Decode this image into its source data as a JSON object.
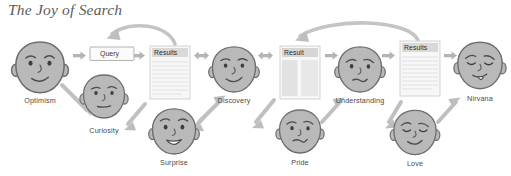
{
  "title": "The Joy of Search",
  "theme": {
    "background": "#ffffff",
    "face_fill": "#b9b9b9",
    "face_stroke": "#6e6e6e",
    "arrow_fill": "#b4b4b4",
    "curve_arrow_fill": "#bfbfbf",
    "doc_fill": "#f4f4f4",
    "doc_stroke": "#c9c9c9",
    "doc_header_fill": "#d8d8d8",
    "doc_line": "#dcdcdc",
    "text": "#4a4a4a",
    "title_text": "#5b5b5b"
  },
  "documents": [
    {
      "id": "query",
      "label": "Query",
      "style": "input-box"
    },
    {
      "id": "results1",
      "label": "Results",
      "style": "lined-page"
    },
    {
      "id": "result2",
      "label": "Result",
      "style": "two-column-page"
    },
    {
      "id": "results3",
      "label": "Results",
      "style": "lined-page"
    }
  ],
  "faces": [
    {
      "id": "optimism",
      "label": "Optimism",
      "emotion": "smiling",
      "row": "top"
    },
    {
      "id": "curiosity",
      "label": "Curiosity",
      "emotion": "neutral-inquiring",
      "row": "bottom"
    },
    {
      "id": "discovery",
      "label": "Discovery",
      "emotion": "pleased-smile",
      "row": "top"
    },
    {
      "id": "surprise",
      "label": "Surprise",
      "emotion": "open-mouth-grin",
      "row": "bottom"
    },
    {
      "id": "understanding",
      "label": "Understanding",
      "emotion": "concerned-wry",
      "row": "top"
    },
    {
      "id": "pride",
      "label": "Pride",
      "emotion": "smirk",
      "row": "bottom"
    },
    {
      "id": "nirvana",
      "label": "Nirvana",
      "emotion": "blissful-tongue",
      "row": "top"
    },
    {
      "id": "love",
      "label": "Love",
      "emotion": "content-smile",
      "row": "bottom"
    }
  ],
  "flow": {
    "straight_arrows": [
      "optimism-to-query",
      "query-to-results1",
      "results1-to-discovery",
      "discovery-to-result2",
      "result2-to-understanding",
      "understanding-to-results3",
      "results3-to-nirvana"
    ],
    "double_arrows": [
      "results1-discovery",
      "discovery-result2"
    ],
    "feedback_curves": [
      "results1-back-to-query",
      "results3-back-to-result2"
    ],
    "branch_arrows": [
      "optimism-to-curiosity",
      "results1-to-surprise",
      "surprise-to-discovery",
      "result2-to-pride",
      "pride-to-understanding",
      "results3-to-love",
      "love-to-nirvana"
    ]
  }
}
